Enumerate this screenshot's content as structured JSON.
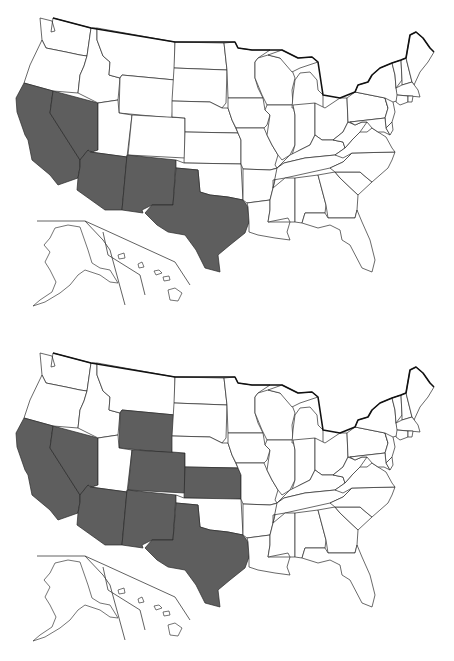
{
  "figure": {
    "shade_color": "#5e5e5e",
    "unshaded_color": "#ffffff",
    "outline_color": "#2a2a2a"
  },
  "maps": [
    {
      "id": "map-top",
      "shaded_states": [
        "CA",
        "NV",
        "AZ",
        "NM",
        "TX"
      ]
    },
    {
      "id": "map-bottom",
      "shaded_states": [
        "CA",
        "NV",
        "AZ",
        "NM",
        "TX",
        "WY",
        "CO",
        "KS"
      ]
    }
  ],
  "states": {
    "WA": "40,18 52,21 55,31 51,32 53,18 91,28 87,56 80,55 66,52 46,48 42,40",
    "OR": "42,40 46,48 66,52 80,55 87,56 84,66 80,75 78,93 53,91 24,83 30,65",
    "CA": "24,83 53,91 50,113 80,160 80,167 78,178 58,185 50,175 32,160 28,140 25,135 17,112 16,98",
    "NV": "53,91 98,103 98,150 92,152 88,150 80,160 50,113",
    "ID": "91,28 97,28 97,40 103,56 110,62 109,75 120,78 118,100 98,103 78,93 80,75 84,66 87,56",
    "MT": "97,28 175,42 175,80 122,75 120,78 109,75 110,62 103,56 97,40",
    "WY": "122,75 175,80 172,118 119,113 120,78",
    "UT": "98,103 118,100 119,113 132,115 127,157 90,152 92,152 98,150",
    "CO": "132,115 185,118 185,158 128,155",
    "AZ": "90,152 127,157 122,210 105,210 77,190 78,178 80,167 80,160 88,150",
    "NM": "127,155 176,160 173,205 152,205 142,210 143,213 122,210",
    "ND": "175,42 224,43 227,70 174,68",
    "SD": "174,68 227,70 226,103 222,108 210,102 172,101",
    "NE": "172,101 210,102 222,108 228,108 232,120 238,133 185,132 185,118 172,117",
    "KS": "185,132 238,133 241,140 241,164 184,163",
    "OK": "176,160 184,163 241,164 243,200 228,197 210,195 200,192 198,170 176,168",
    "TX": "176,168 198,170 200,192 210,195 228,197 243,200 248,207 249,222 245,233 230,245 218,255 220,272 205,268 196,250 185,235 168,232 157,225 145,213 152,205 173,205",
    "MN": "224,43 235,42 238,48 252,50 270,50 258,58 255,62 255,78 258,88 263,98 228,98 227,70",
    "IA": "228,98 263,98 265,110 270,115 267,125 264,128 236,128 232,120 228,108",
    "MO": "236,128 264,128 267,135 272,145 278,155 275,165 277,168 270,170 243,169 241,164 241,140 238,133",
    "AR": "243,169 270,170 278,168 273,188 270,200 247,203 243,200",
    "LA": "247,203 270,200 270,210 268,222 290,222 287,232 290,240 275,238 258,235 249,232 249,222 248,207",
    "WI": "258,58 268,55 280,58 290,65 295,78 292,90 293,105 267,105 262,95 255,78 255,62",
    "IL": "267,105 293,105 295,115 295,145 290,155 282,160 278,155 272,145 267,135 270,115 265,110",
    "MI": "292,108 293,95 295,80 300,73 310,72 317,80 318,90 323,95 323,108",
    "MI_UP": "268,55 282,50 298,58 312,57 318,62 300,68 292,72 280,58",
    "IN": "293,105 315,103 315,135 310,145 300,150 292,155 295,145 295,115",
    "OH": "315,103 325,108 340,98 347,98 348,122 343,132 333,140 322,140 315,135",
    "KY": "277,168 283,162 290,155 300,150 310,145 315,135 322,140 333,140 343,142 345,148 335,155 305,158 284,163",
    "TN": "277,168 284,163 305,158 335,155 350,150 352,153 343,162 330,168 285,178 273,180 273,188",
    "MS": "273,188 285,178 295,178 295,222 290,222 288,218 268,222 270,210 270,200",
    "AL": "295,178 318,175 326,205 325,213 305,213 302,223 295,222",
    "GA": "318,175 335,172 340,178 358,195 357,210 355,218 328,218 326,205",
    "FL": "302,223 305,213 325,213 328,218 355,218 357,210 362,222 370,240 375,260 372,272 362,268 350,245 342,240 340,230 330,225 318,228",
    "SC": "335,172 360,172 367,178 372,182 358,195 340,178",
    "NC": "330,168 343,162 352,153 395,152 392,160 388,168 372,182 367,178 360,172 335,172",
    "VA": "335,155 345,148 352,140 360,132 367,132 372,128 378,132 386,137 392,148 395,152 352,153 343,158",
    "WV": "343,132 348,122 355,125 362,122 367,122 360,132 352,140 345,148 343,142 333,140",
    "PA": "347,98 355,92 385,98 388,108 385,118 350,122 348,122",
    "NY": "355,92 358,85 368,82 372,75 380,68 392,63 395,75 396,88 400,100 393,102 388,108 385,98",
    "NJ": "385,98 393,102 395,112 392,122 386,128 385,118 388,108",
    "MD": "350,122 385,118 386,128 390,135 384,132 378,132 372,128 367,122 362,122 355,125",
    "DE": "386,128 392,122 393,130 390,135",
    "VT": "392,63 401,60 402,80 396,88 395,75",
    "NH": "401,60 406,58 412,82 402,85 402,80",
    "ME": "406,58 410,35 416,32 423,38 430,48 434,52 428,62 420,72 414,85 412,82",
    "MA": "396,88 402,85 412,82 418,90 420,97 410,96 397,95",
    "CT": "397,95 408,96 408,102 400,105 396,102",
    "RI": "408,96 413,96 412,102 408,102"
  },
  "alaska": "55,228 68,225 80,227 88,250 92,263 100,268 110,270 118,283 110,282 100,275 85,270 78,275 70,285 60,293 45,302 33,306 40,300 52,292 56,282 50,270 45,262 50,252 44,245 50,238",
  "hawaii": [
    "118,255 124,253 125,258 119,259",
    "138,264 142,262 144,267 139,268",
    "154,271 159,270 162,273 156,275",
    "163,277 169,276 170,280 164,281",
    "168,290 175,288 182,293 178,301 170,300"
  ]
}
